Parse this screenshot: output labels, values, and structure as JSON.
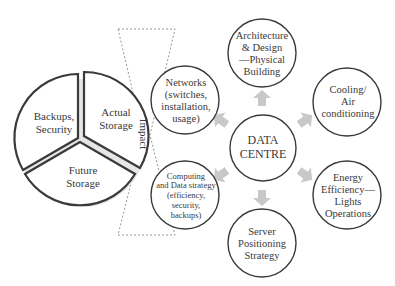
{
  "diagram": {
    "center": {
      "label": "DATA\nCENTRE"
    },
    "nodes": [
      {
        "id": "architecture",
        "label": "Architecture\n& Design\n—Physical\nBuilding",
        "position": "top"
      },
      {
        "id": "cooling",
        "label": "Cooling/\nAir\nconditioning",
        "position": "top-right"
      },
      {
        "id": "energy",
        "label": "Energy\nEfficiency—\nLights\nOperations",
        "position": "bottom-right"
      },
      {
        "id": "server",
        "label": "Server\nPositioning\nStrategy",
        "position": "bottom"
      },
      {
        "id": "computing",
        "label": "Computing\nand Data strategy\n(efficiency,\nsecurity,\nbackups)",
        "position": "bottom-left"
      },
      {
        "id": "networks",
        "label": "Networks\n(switches,\ninstallation,\nusage)",
        "position": "top-left"
      }
    ],
    "impact_label": "Impact",
    "pie": {
      "slices": [
        {
          "label": "Actual\nStorage"
        },
        {
          "label": "Future\nStorage"
        },
        {
          "label": "Backups,\nSecurity"
        }
      ]
    },
    "colors": {
      "stroke": "#3a3a3a",
      "arrow": "#c8c8c8",
      "dashed": "#8a8a8a"
    }
  }
}
